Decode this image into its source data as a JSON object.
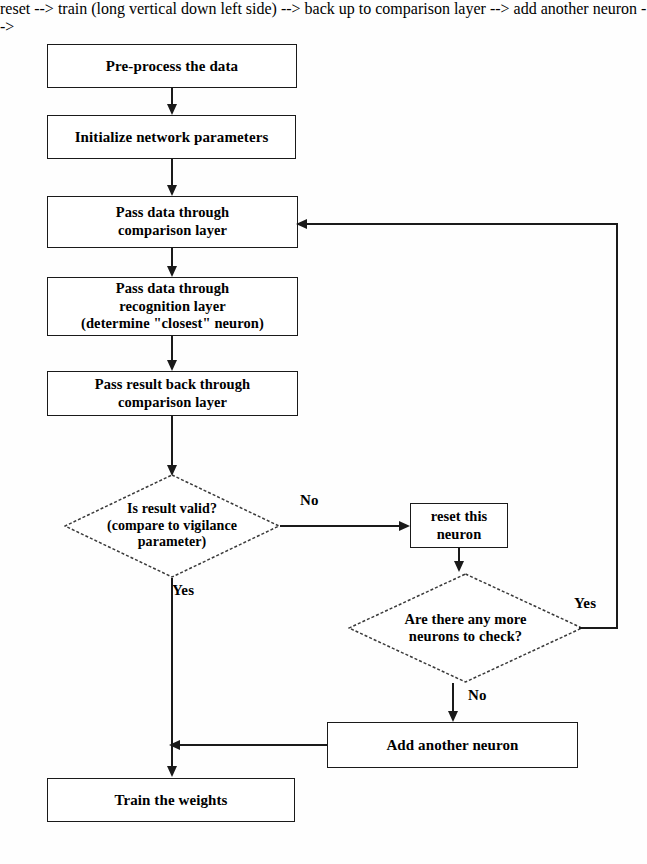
{
  "diagram": {
    "type": "flowchart",
    "nodes": [
      {
        "id": "preprocess",
        "shape": "process",
        "label": "Pre-process the data"
      },
      {
        "id": "initialize",
        "shape": "process",
        "label": "Initialize network parameters"
      },
      {
        "id": "comparison",
        "shape": "process",
        "label": "Pass data through\ncomparison layer"
      },
      {
        "id": "recognition",
        "shape": "process",
        "label": "Pass data through\nrecognition layer\n(determine \"closest\" neuron)"
      },
      {
        "id": "passback",
        "shape": "process",
        "label": "Pass result back through\ncomparison layer"
      },
      {
        "id": "isvalid",
        "shape": "decision",
        "label": "Is result valid?\n(compare to vigilance\nparameter)"
      },
      {
        "id": "reset",
        "shape": "process",
        "label": "reset this\nneuron"
      },
      {
        "id": "moreneurons",
        "shape": "decision",
        "label": "Are there any more\nneurons to check?"
      },
      {
        "id": "addneuron",
        "shape": "process",
        "label": "Add another neuron"
      },
      {
        "id": "train",
        "shape": "process",
        "label": "Train the weights"
      }
    ],
    "edge_labels": {
      "isvalid_no": "No",
      "isvalid_yes": "Yes",
      "moreneurons_yes": "Yes",
      "moreneurons_no": "No"
    },
    "colors": {
      "stroke": "#1a1a1a",
      "fill": "#ffffff",
      "text": "#000000",
      "background": "#fefefe"
    }
  }
}
